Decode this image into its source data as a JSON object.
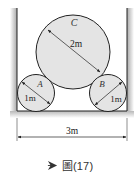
{
  "figure": {
    "caption_prefix_icon": "play-arrow-icon",
    "caption": "圖(17)",
    "colors": {
      "circle_fill": "#e4e4e4",
      "stroke": "#222222",
      "wall_shade": "#9a9a9a",
      "floor_shade": "#cfcfcf",
      "caption_icon": "#333333"
    },
    "container": {
      "width_label": "3m"
    },
    "circles": [
      {
        "id": "C",
        "label": "C",
        "diameter_label": "2m",
        "cx": 73,
        "cy": 52,
        "r": 37
      },
      {
        "id": "A",
        "label": "A",
        "diameter_label": "1m",
        "cx": 36,
        "cy": 93,
        "r": 18
      },
      {
        "id": "B",
        "label": "B",
        "diameter_label": "1m",
        "cx": 108,
        "cy": 93,
        "r": 18
      }
    ]
  }
}
